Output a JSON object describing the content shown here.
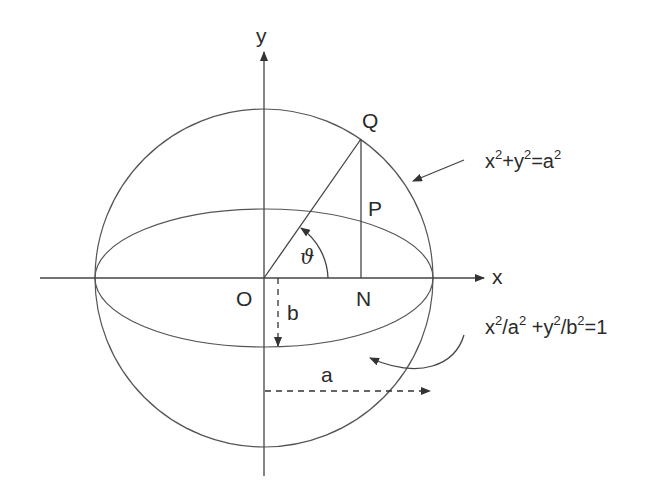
{
  "figure": {
    "type": "geometry-diagram"
  },
  "axes": {
    "x_label": "x",
    "y_label": "y",
    "origin_label": "O"
  },
  "points": {
    "Q": "Q",
    "P": "P",
    "N": "N"
  },
  "angle_label": "ϑ",
  "dimensions": {
    "semi_minor": "b",
    "semi_major": "a"
  },
  "equations": {
    "circle": {
      "parts": [
        "x",
        "2",
        "+y",
        "2",
        "=a",
        "2"
      ],
      "text": "x²+y²=a²"
    },
    "ellipse": {
      "parts": [
        "x",
        "2",
        "/a",
        "2",
        " +y",
        "2",
        "/b",
        "2",
        "=1"
      ],
      "text": "x²/a² +y²/b²=1"
    }
  },
  "colors": {
    "stroke": "#444444",
    "text": "#2a2a2a",
    "background": "#ffffff"
  }
}
